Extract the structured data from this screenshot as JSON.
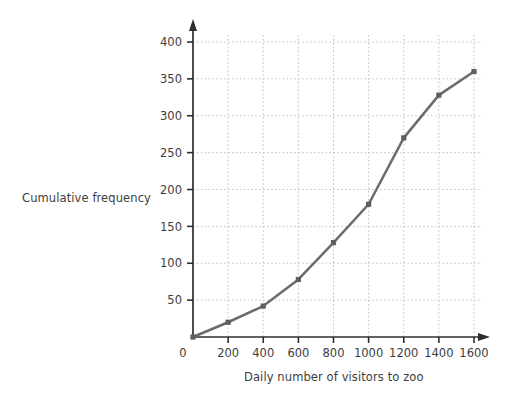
{
  "chart_data": {
    "type": "line",
    "title": "",
    "xlabel": "Daily number of visitors to zoo",
    "ylabel": "Cumulative frequency",
    "x": [
      0,
      200,
      400,
      600,
      800,
      1000,
      1200,
      1400,
      1600
    ],
    "values": [
      0,
      20,
      42,
      78,
      128,
      180,
      270,
      328,
      360
    ],
    "series": [
      {
        "name": "Cumulative frequency",
        "values": [
          0,
          20,
          42,
          78,
          128,
          180,
          270,
          328,
          360
        ]
      }
    ],
    "xlim": [
      0,
      1600
    ],
    "ylim": [
      0,
      400
    ],
    "xticks": [
      0,
      200,
      400,
      600,
      800,
      1000,
      1200,
      1400,
      1600
    ],
    "yticks": [
      0,
      50,
      100,
      150,
      200,
      250,
      300,
      350,
      400
    ],
    "xtick_labels": [
      "0",
      "200",
      "400",
      "600",
      "800",
      "1000",
      "1200",
      "1400",
      "1600"
    ],
    "ytick_labels": [
      "0",
      "50",
      "100",
      "150",
      "200",
      "250",
      "300",
      "350",
      "400"
    ],
    "grid": true,
    "legend": "none",
    "markers": true,
    "line_color": "#6b6b6b",
    "marker_color": "#5f5f5f",
    "grid_color": "#b9bcc4",
    "axis_color": "#2e2e2e",
    "background_color": "#ffffff",
    "x_axis_arrow": true,
    "y_axis_arrow": true,
    "origin_label": "0"
  }
}
